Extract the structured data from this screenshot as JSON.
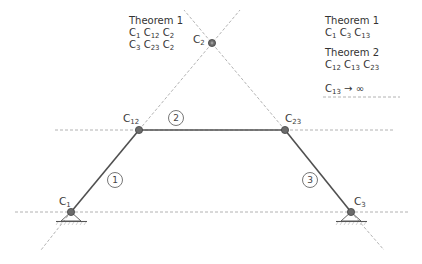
{
  "diagram": {
    "type": "four-bar linkage instant centers (Kennedy theorem)",
    "colors": {
      "link": "#555555",
      "dashed": "#9a9a9a",
      "joint_fill": "#6b6b6b",
      "text": "#333333"
    },
    "joints": [
      {
        "id": "C1",
        "label_main": "C",
        "label_sub": "1",
        "x": 71,
        "y": 212,
        "grounded": true
      },
      {
        "id": "C12",
        "label_main": "C",
        "label_sub": "12",
        "x": 139,
        "y": 130,
        "grounded": false
      },
      {
        "id": "C23",
        "label_main": "C",
        "label_sub": "23",
        "x": 285,
        "y": 130,
        "grounded": false
      },
      {
        "id": "C3",
        "label_main": "C",
        "label_sub": "3",
        "x": 351,
        "y": 212,
        "grounded": true
      },
      {
        "id": "C2",
        "label_main": "C",
        "label_sub": "2",
        "x": 212,
        "y": 43,
        "grounded": false
      }
    ],
    "links": [
      {
        "number": "1",
        "from": "C1",
        "to": "C12"
      },
      {
        "number": "2",
        "from": "C12",
        "to": "C23"
      },
      {
        "number": "3",
        "from": "C23",
        "to": "C3"
      }
    ],
    "link_numbers": [
      "1",
      "2",
      "3"
    ]
  },
  "notes": {
    "left": {
      "title": "Theorem 1",
      "line1": [
        {
          "m": "C",
          "s": "1"
        },
        {
          "m": "C",
          "s": "12"
        },
        {
          "m": "C",
          "s": "2"
        }
      ],
      "line2": [
        {
          "m": "C",
          "s": "3"
        },
        {
          "m": "C",
          "s": "23"
        },
        {
          "m": "C",
          "s": "2"
        }
      ]
    },
    "right": {
      "theorem1_title": "Theorem 1",
      "theorem1_line": [
        {
          "m": "C",
          "s": "1"
        },
        {
          "m": "C",
          "s": "3"
        },
        {
          "m": "C",
          "s": "13"
        }
      ],
      "theorem2_title": "Theorem 2",
      "theorem2_line": [
        {
          "m": "C",
          "s": "12"
        },
        {
          "m": "C",
          "s": "13"
        },
        {
          "m": "C",
          "s": "23"
        }
      ],
      "infinity_main": "C",
      "infinity_sub": "13",
      "infinity_arrow": "→ ∞"
    }
  }
}
